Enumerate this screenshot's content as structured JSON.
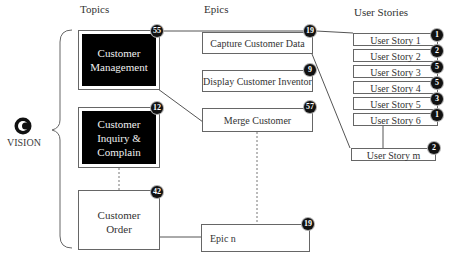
{
  "headers": {
    "topics": "Topics",
    "epics": "Epics",
    "user_stories": "User Stories"
  },
  "vision": {
    "label": "VISION",
    "icon": "vision-c-icon"
  },
  "topics": [
    {
      "label_lines": [
        "Customer",
        "Management"
      ],
      "badge": "55",
      "style": "dark"
    },
    {
      "label_lines": [
        "Customer",
        "Inquiry &",
        "Complain"
      ],
      "badge": "12",
      "style": "dark"
    },
    {
      "label_lines": [
        "Customer",
        "Order"
      ],
      "badge": "42",
      "style": "light"
    }
  ],
  "epics": [
    {
      "label": "Capture Customer Data",
      "badge": "19"
    },
    {
      "label": "Display Customer Inventor",
      "badge": "9"
    },
    {
      "label": "Merge Customer",
      "badge": "57"
    },
    {
      "label": "Epic n",
      "badge": "19"
    }
  ],
  "user_stories": [
    {
      "label": "User Story 1",
      "badge": "1"
    },
    {
      "label": "User Story 2",
      "badge": "2"
    },
    {
      "label": "User Story 3",
      "badge": "5"
    },
    {
      "label": "User Story 4",
      "badge": "5"
    },
    {
      "label": "User Story 5",
      "badge": "3"
    },
    {
      "label": "User Story 6",
      "badge": "1"
    },
    {
      "label": "User Story m",
      "badge": "2"
    }
  ]
}
